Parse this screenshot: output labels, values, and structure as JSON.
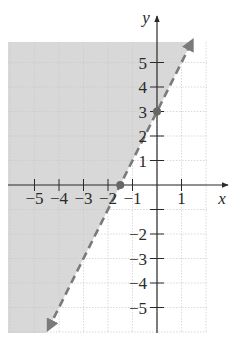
{
  "chart_data": {
    "type": "line",
    "title": "",
    "xlabel": "x",
    "ylabel": "y",
    "xlim": [
      -6,
      2
    ],
    "ylim": [
      -6,
      6
    ],
    "grid": true,
    "x_ticks": [
      -5,
      -4,
      -3,
      -2,
      -1,
      1
    ],
    "y_ticks": [
      5,
      4,
      3,
      2,
      1,
      -2,
      -3,
      -4,
      -5
    ],
    "x_tick_labels": [
      "−5",
      "−4",
      "−3",
      "−2",
      "−1",
      "1"
    ],
    "y_tick_labels": [
      "5",
      "4",
      "3",
      "2",
      "1",
      "−2",
      "−3",
      "−4",
      "−5"
    ],
    "series": [
      {
        "name": "boundary line y = 2x + 3",
        "style": "dashed",
        "slope": 2,
        "intercept": 3,
        "x": [
          -4.5,
          -1.5,
          0,
          1.5
        ],
        "y": [
          -6,
          0,
          3,
          6
        ]
      }
    ],
    "points": [
      {
        "x": 0,
        "y": 3,
        "label": "y-intercept"
      },
      {
        "x": -1.5,
        "y": 0,
        "label": "x-intercept"
      }
    ],
    "shaded_region": {
      "description": "region above/left of the dashed line",
      "inequality": "y > 2x + 3",
      "color": "#d8d8d8"
    },
    "colors": {
      "shade": "#d8d8d8",
      "line": "#7a7a7a",
      "axis": "#2a2a2a",
      "grid": "#c8c8c8",
      "point": "#666666"
    }
  }
}
